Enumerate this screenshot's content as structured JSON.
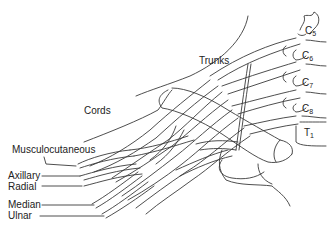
{
  "diagram": {
    "line_color": "#3a3a3a",
    "text_color": "#222222",
    "background": "#ffffff",
    "labels": {
      "trunks": "Trunks",
      "cords": "Cords",
      "musculocutaneous": "Musculocutaneous",
      "axillary": "Axillary",
      "radial": "Radial",
      "median": "Median",
      "ulnar": "Ulnar"
    },
    "roots": [
      {
        "letter": "C",
        "sub": "5"
      },
      {
        "letter": "C",
        "sub": "6"
      },
      {
        "letter": "C",
        "sub": "7"
      },
      {
        "letter": "C",
        "sub": "8"
      },
      {
        "letter": "T",
        "sub": "1"
      }
    ]
  }
}
